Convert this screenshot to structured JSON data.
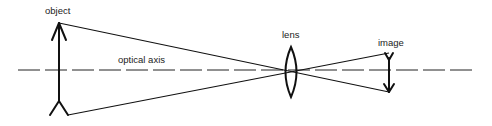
{
  "diagram": {
    "labels": {
      "object": "object",
      "lens": "lens",
      "image": "image",
      "optical_axis": "optical axis"
    },
    "colors": {
      "line": "#111111",
      "background": "#ffffff"
    },
    "geometry": {
      "optical_axis_y": 70,
      "object": {
        "x": 59,
        "top_y": 23,
        "bottom_y": 115
      },
      "lens": {
        "x": 291,
        "top_y": 47,
        "bottom_y": 97
      },
      "image": {
        "x": 389,
        "top_y": 53,
        "bottom_y": 92
      },
      "ray_crossing": {
        "x": 291,
        "y": 72
      }
    }
  }
}
